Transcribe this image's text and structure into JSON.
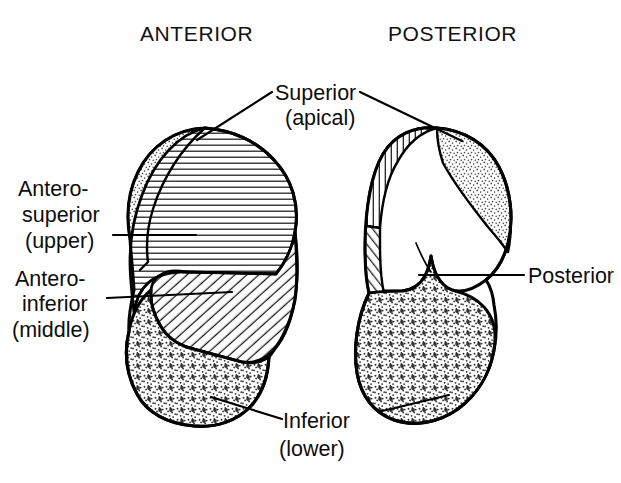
{
  "figure": {
    "title_left": "ANTERIOR",
    "title_right": "POSTERIOR",
    "labels": {
      "superior_line1": "Superior",
      "superior_line2": "(apical)",
      "antero_superior_line1": "Antero-",
      "antero_superior_line2": "superior",
      "antero_superior_line3": "(upper)",
      "antero_inferior_line1": "Antero-",
      "antero_inferior_line2": "inferior",
      "antero_inferior_line3": "(middle)",
      "posterior": "Posterior",
      "inferior_line1": "Inferior",
      "inferior_line2": "(lower)"
    },
    "colors": {
      "ink": "#000000",
      "background": "#ffffff",
      "stipple_fine": "#3a3a3a",
      "hatch": "#1a1a1a"
    },
    "segments": [
      {
        "name": "superior-apical",
        "view": "anterior",
        "fill": "stipple-fine"
      },
      {
        "name": "antero-superior-upper",
        "view": "anterior",
        "fill": "hatch-horizontal"
      },
      {
        "name": "antero-inferior-middle",
        "view": "anterior",
        "fill": "hatch-diagonal"
      },
      {
        "name": "inferior-lower",
        "view": "anterior",
        "fill": "stipple-coarse"
      },
      {
        "name": "superior-apical",
        "view": "posterior",
        "fill": "stipple-fine"
      },
      {
        "name": "antero-superior-upper",
        "view": "posterior",
        "fill": "hatch-horizontal"
      },
      {
        "name": "antero-inferior-middle",
        "view": "posterior",
        "fill": "hatch-diagonal"
      },
      {
        "name": "posterior",
        "view": "posterior",
        "fill": "none"
      },
      {
        "name": "inferior-lower",
        "view": "posterior",
        "fill": "stipple-coarse"
      }
    ]
  }
}
